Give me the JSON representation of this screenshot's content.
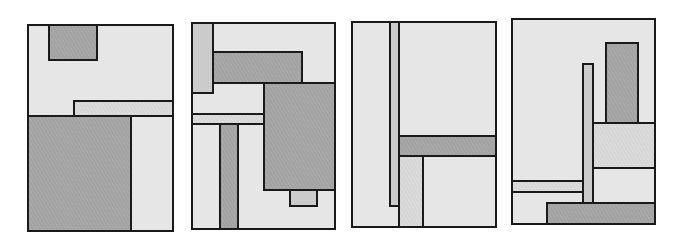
{
  "figure": {
    "colors": {
      "outline": "#1a1a1a",
      "light": "#e6e6e6",
      "mid": "#cbcbcb",
      "hatch": "#d8d8d8",
      "dark": "#a4a4a4"
    },
    "panels": [
      {
        "id": 1,
        "x": 27,
        "y": 24,
        "w": 147,
        "h": 208,
        "rects": [
          {
            "x": 48,
            "y": 24,
            "w": 50,
            "h": 37,
            "fill": "dark"
          },
          {
            "x": 73,
            "y": 100,
            "w": 101,
            "h": 17,
            "fill": "hatch"
          },
          {
            "x": 27,
            "y": 115,
            "w": 105,
            "h": 117,
            "fill": "dark"
          },
          {
            "x": 130,
            "y": 115,
            "w": 44,
            "h": 117,
            "fill": "light"
          }
        ]
      },
      {
        "id": 2,
        "x": 191,
        "y": 22,
        "w": 145,
        "h": 208,
        "rects": [
          {
            "x": 191,
            "y": 22,
            "w": 23,
            "h": 72,
            "fill": "mid"
          },
          {
            "x": 212,
            "y": 51,
            "w": 91,
            "h": 33,
            "fill": "dark"
          },
          {
            "x": 263,
            "y": 82,
            "w": 73,
            "h": 109,
            "fill": "dark"
          },
          {
            "x": 191,
            "y": 113,
            "w": 74,
            "h": 12,
            "fill": "hatch"
          },
          {
            "x": 219,
            "y": 123,
            "w": 20,
            "h": 107,
            "fill": "dark"
          },
          {
            "x": 289,
            "y": 189,
            "w": 29,
            "h": 18,
            "fill": "mid"
          }
        ]
      },
      {
        "id": 3,
        "x": 351,
        "y": 21,
        "w": 146,
        "h": 207,
        "rects": [
          {
            "x": 389,
            "y": 21,
            "w": 11,
            "h": 186,
            "fill": "mid"
          },
          {
            "x": 398,
            "y": 135,
            "w": 99,
            "h": 22,
            "fill": "dark"
          },
          {
            "x": 398,
            "y": 155,
            "w": 26,
            "h": 73,
            "fill": "hatch"
          },
          {
            "x": 422,
            "y": 155,
            "w": 75,
            "h": 73,
            "fill": "light"
          }
        ]
      },
      {
        "id": 4,
        "x": 511,
        "y": 18,
        "w": 145,
        "h": 207,
        "rects": [
          {
            "x": 605,
            "y": 42,
            "w": 34,
            "h": 82,
            "fill": "dark"
          },
          {
            "x": 582,
            "y": 63,
            "w": 12,
            "h": 142,
            "fill": "mid"
          },
          {
            "x": 592,
            "y": 122,
            "w": 64,
            "h": 47,
            "fill": "hatch"
          },
          {
            "x": 592,
            "y": 167,
            "w": 64,
            "h": 38,
            "fill": "light"
          },
          {
            "x": 511,
            "y": 180,
            "w": 73,
            "h": 13,
            "fill": "hatch"
          },
          {
            "x": 546,
            "y": 202,
            "w": 110,
            "h": 23,
            "fill": "dark"
          }
        ]
      }
    ]
  }
}
